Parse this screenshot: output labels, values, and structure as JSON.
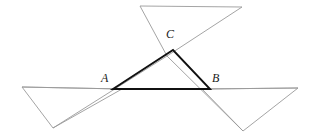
{
  "figure": {
    "width": 313,
    "height": 137,
    "background_color": "#ffffff",
    "main_triangle": {
      "name": "triangle-abc",
      "stroke_color": "#111111",
      "stroke_width": 1.9,
      "fill": "none",
      "vertices": [
        {
          "label": "A",
          "x": 113,
          "y": 89
        },
        {
          "label": "B",
          "x": 210,
          "y": 89
        },
        {
          "label": "C",
          "x": 173,
          "y": 50
        }
      ],
      "sides": [
        {
          "name": "side-ab",
          "from": "A",
          "to": "B"
        },
        {
          "name": "side-bc",
          "from": "B",
          "to": "C"
        },
        {
          "name": "side-ca",
          "from": "C",
          "to": "A"
        }
      ]
    },
    "exterior_triangles": [
      {
        "name": "left-exterior-triangle",
        "stroke_color": "#9a9a9a",
        "stroke_width": 0.9,
        "fill": "none",
        "points": "22,87 122,89 53,128"
      },
      {
        "name": "right-exterior-triangle",
        "stroke_color": "#9a9a9a",
        "stroke_width": 0.9,
        "fill": "none",
        "points": "202,89 298,88 243,131"
      },
      {
        "name": "top-exterior-triangle",
        "stroke_color": "#9a9a9a",
        "stroke_width": 0.9,
        "fill": "none",
        "points": "140,6 242,7 167,56"
      }
    ],
    "extension_rays": [
      {
        "name": "ray-ba-extended-left",
        "stroke_color": "#9a9a9a",
        "stroke_width": 0.9,
        "x1": 22,
        "y1": 87,
        "x2": 122,
        "y2": 89
      },
      {
        "name": "ray-ab-extended-right",
        "stroke_color": "#9a9a9a",
        "stroke_width": 0.9,
        "x1": 202,
        "y1": 89,
        "x2": 298,
        "y2": 88
      },
      {
        "name": "ray-ca-extended-down-left",
        "stroke_color": "#9a9a9a",
        "stroke_width": 0.9,
        "x1": 167,
        "y1": 56,
        "x2": 53,
        "y2": 128
      },
      {
        "name": "ray-cb-extended-down-right",
        "stroke_color": "#9a9a9a",
        "stroke_width": 0.9,
        "x1": 167,
        "y1": 56,
        "x2": 243,
        "y2": 131
      }
    ],
    "labels": [
      {
        "name": "label-a",
        "text": "A",
        "x": 101,
        "y": 72
      },
      {
        "name": "label-b",
        "text": "B",
        "x": 212,
        "y": 72
      },
      {
        "name": "label-c",
        "text": "C",
        "x": 166,
        "y": 28
      }
    ]
  },
  "chart_data": {
    "type": "diagram",
    "points": {
      "A": [
        113,
        89
      ],
      "B": [
        210,
        89
      ],
      "C": [
        173,
        50
      ]
    },
    "labels": [
      "A",
      "B",
      "C"
    ],
    "series": [
      {
        "name": "triangle-abc",
        "kind": "closed-polygon",
        "emphasis": "primary",
        "color": "#111111",
        "vertices": [
          [
            113,
            89
          ],
          [
            210,
            89
          ],
          [
            173,
            50
          ]
        ]
      },
      {
        "name": "left-exterior-triangle",
        "kind": "closed-polygon",
        "emphasis": "secondary",
        "color": "#9a9a9a",
        "vertices": [
          [
            22,
            87
          ],
          [
            122,
            89
          ],
          [
            53,
            128
          ]
        ]
      },
      {
        "name": "right-exterior-triangle",
        "kind": "closed-polygon",
        "emphasis": "secondary",
        "color": "#9a9a9a",
        "vertices": [
          [
            202,
            89
          ],
          [
            298,
            88
          ],
          [
            243,
            131
          ]
        ]
      },
      {
        "name": "top-exterior-triangle",
        "kind": "closed-polygon",
        "emphasis": "secondary",
        "color": "#9a9a9a",
        "vertices": [
          [
            140,
            6
          ],
          [
            242,
            7
          ],
          [
            167,
            56
          ]
        ]
      }
    ],
    "grid": false,
    "legend": "none"
  }
}
